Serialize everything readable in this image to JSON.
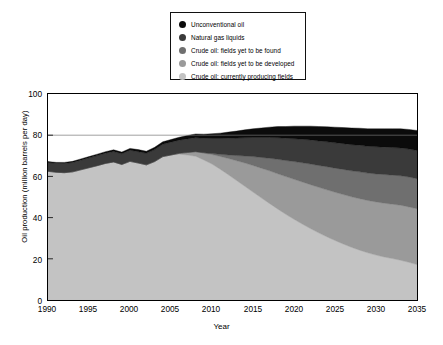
{
  "chart_data": {
    "type": "area",
    "stacked": true,
    "title": "",
    "xlabel": "Year",
    "ylabel": "Oil production (million barrels per day)",
    "xlim": [
      1990,
      2035
    ],
    "ylim": [
      0,
      100
    ],
    "xticks": [
      1990,
      1995,
      2000,
      2005,
      2010,
      2015,
      2020,
      2025,
      2030,
      2035
    ],
    "yticks": [
      0,
      20,
      40,
      60,
      80,
      100
    ],
    "grid": false,
    "reference_lines": [
      {
        "axis": "y",
        "value": 80,
        "color": "#777777"
      }
    ],
    "legend_position": "top-center",
    "x": [
      1990,
      1991,
      1992,
      1993,
      1994,
      1995,
      1996,
      1997,
      1998,
      1999,
      2000,
      2001,
      2002,
      2003,
      2004,
      2005,
      2006,
      2007,
      2008,
      2009,
      2010,
      2011,
      2012,
      2013,
      2014,
      2015,
      2016,
      2017,
      2018,
      2019,
      2020,
      2021,
      2022,
      2023,
      2024,
      2025,
      2026,
      2027,
      2028,
      2029,
      2030,
      2031,
      2032,
      2033,
      2034,
      2035
    ],
    "series": [
      {
        "name": "Crude oil: currently producing fields",
        "color": "#c3c3c3",
        "values": [
          62.5,
          62.0,
          61.8,
          62.2,
          63.2,
          64.2,
          65.2,
          66.3,
          67.0,
          65.8,
          67.3,
          66.5,
          65.6,
          67.2,
          69.6,
          70.4,
          70.8,
          70.4,
          69.8,
          68.0,
          66.0,
          63.5,
          60.8,
          58.0,
          55.2,
          52.4,
          49.6,
          46.9,
          44.2,
          41.6,
          39.2,
          36.9,
          34.7,
          32.6,
          30.7,
          28.9,
          27.2,
          25.6,
          24.2,
          22.9,
          21.8,
          20.9,
          20.1,
          19.3,
          18.3,
          17.2
        ]
      },
      {
        "name": "Crude oil: fields yet to be developed",
        "color": "#9a9a9a",
        "values": [
          0,
          0,
          0,
          0,
          0,
          0,
          0,
          0,
          0,
          0,
          0,
          0,
          0,
          0,
          0,
          0,
          0.4,
          1.2,
          2.2,
          3.3,
          4.6,
          6.2,
          7.9,
          9.6,
          11.3,
          12.9,
          14.4,
          15.8,
          17.1,
          18.3,
          19.4,
          20.4,
          21.3,
          22.1,
          22.8,
          23.4,
          24.0,
          24.5,
          25.0,
          25.4,
          25.8,
          26.1,
          26.4,
          26.7,
          26.9,
          27.1
        ]
      },
      {
        "name": "Crude oil: fields yet to be found",
        "color": "#6f6f6f",
        "values": [
          0,
          0,
          0,
          0,
          0,
          0,
          0,
          0,
          0,
          0,
          0,
          0,
          0,
          0,
          0,
          0,
          0,
          0,
          0,
          0.2,
          0.5,
          1.0,
          1.7,
          2.5,
          3.4,
          4.3,
          5.2,
          6.1,
          7.0,
          7.8,
          8.6,
          9.3,
          10.0,
          10.6,
          11.2,
          11.7,
          12.2,
          12.6,
          13.0,
          13.3,
          13.6,
          13.9,
          14.1,
          14.3,
          14.5,
          14.6
        ]
      },
      {
        "name": "Natural gas liquids",
        "color": "#3a3a3a",
        "values": [
          4.3,
          4.4,
          4.5,
          4.6,
          4.7,
          4.8,
          4.9,
          5.0,
          5.1,
          5.2,
          5.4,
          5.5,
          5.6,
          5.8,
          6.0,
          6.2,
          6.4,
          6.6,
          6.8,
          7.0,
          7.3,
          7.7,
          8.1,
          8.5,
          8.9,
          9.3,
          9.7,
          10.1,
          10.5,
          10.8,
          11.1,
          11.4,
          11.7,
          11.9,
          12.1,
          12.3,
          12.5,
          12.7,
          12.9,
          13.0,
          13.2,
          13.3,
          13.4,
          13.5,
          13.6,
          13.7
        ]
      },
      {
        "name": "Unconventional oil",
        "color": "#0b0b0b",
        "values": [
          0.4,
          0.4,
          0.5,
          0.5,
          0.6,
          0.6,
          0.7,
          0.7,
          0.8,
          0.8,
          0.9,
          1.0,
          1.0,
          1.1,
          1.2,
          1.3,
          1.4,
          1.6,
          1.8,
          2.0,
          2.3,
          2.6,
          3.0,
          3.4,
          3.8,
          4.2,
          4.6,
          5.0,
          5.4,
          5.7,
          6.1,
          6.4,
          6.7,
          7.0,
          7.3,
          7.6,
          7.8,
          8.1,
          8.3,
          8.5,
          8.7,
          8.9,
          9.1,
          9.3,
          9.5,
          9.7
        ]
      }
    ]
  },
  "legend": {
    "items": [
      {
        "label": "Unconventional oil",
        "color": "#0b0b0b"
      },
      {
        "label": "Natural gas liquids",
        "color": "#3a3a3a"
      },
      {
        "label": "Crude oil: fields yet to be found",
        "color": "#6f6f6f"
      },
      {
        "label": "Crude oil: fields yet to be developed",
        "color": "#9a9a9a"
      },
      {
        "label": "Crude oil: currently producing fields",
        "color": "#c3c3c3"
      }
    ]
  },
  "axes": {
    "y_title": "Oil production (million barrels per day)",
    "x_title": "Year",
    "y_ticks": [
      "100",
      "80",
      "60",
      "40",
      "20",
      "0"
    ],
    "x_ticks": [
      "1990",
      "1995",
      "2000",
      "2005",
      "2010",
      "2015",
      "2020",
      "2025",
      "2030",
      "2035"
    ]
  }
}
